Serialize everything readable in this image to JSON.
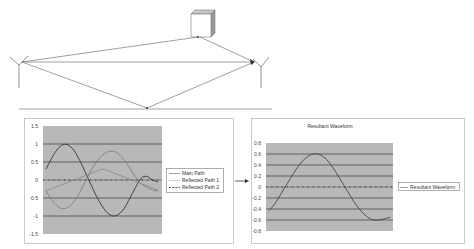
{
  "diagram": {
    "elements": [
      "transmitter-antenna",
      "receiver-antenna",
      "building-reflector",
      "ground-line"
    ],
    "paths": [
      "direct path",
      "path via building",
      "path via ground reflection"
    ]
  },
  "chart_data": [
    {
      "type": "line",
      "title": "",
      "xlabel": "",
      "ylabel": "",
      "ylim": [
        -1.5,
        1.5
      ],
      "yticks": [
        "1.5",
        "1",
        "0.5",
        "0",
        "-0.5",
        "-1",
        "-1.5"
      ],
      "grid": true,
      "legend_position": "right",
      "x": [
        0,
        1,
        2,
        3,
        4,
        5,
        6,
        7,
        8,
        9,
        10,
        11,
        12,
        13,
        14,
        15,
        16,
        17,
        18,
        19,
        20
      ],
      "series": [
        {
          "name": "Main Path",
          "style": "solid",
          "values": [
            0.3,
            0.6,
            0.85,
            0.98,
            0.97,
            0.82,
            0.55,
            0.22,
            -0.12,
            -0.45,
            -0.72,
            -0.92,
            -1.0,
            -0.95,
            -0.78,
            -0.5,
            -0.2,
            0.05,
            0.1,
            0.0,
            -0.05
          ]
        },
        {
          "name": "Reflected Path 1",
          "style": "dotted",
          "values": [
            -0.3,
            -0.55,
            -0.72,
            -0.8,
            -0.75,
            -0.6,
            -0.35,
            -0.05,
            0.25,
            0.5,
            0.68,
            0.78,
            0.8,
            0.72,
            0.55,
            0.32,
            0.08,
            -0.1,
            -0.2,
            -0.28,
            -0.3
          ]
        },
        {
          "name": "Reflected Path 2",
          "style": "dashed",
          "values": [
            -0.3,
            -0.24,
            -0.18,
            -0.12,
            -0.06,
            0.0,
            0.06,
            0.12,
            0.18,
            0.24,
            0.3,
            0.26,
            0.2,
            0.14,
            0.08,
            0.02,
            -0.04,
            -0.1,
            -0.16,
            -0.22,
            -0.28
          ]
        }
      ]
    },
    {
      "type": "line",
      "title": "Resultant Waveform",
      "xlabel": "",
      "ylabel": "",
      "ylim": [
        -0.8,
        0.8
      ],
      "yticks": [
        "0.8",
        "0.6",
        "0.4",
        "0.2",
        "0",
        "-0.2",
        "-0.4",
        "-0.6",
        "-0.8"
      ],
      "grid": true,
      "legend_position": "right",
      "x": [
        0,
        1,
        2,
        3,
        4,
        5,
        6,
        7,
        8,
        9,
        10,
        11,
        12,
        13,
        14,
        15,
        16,
        17,
        18,
        19,
        20
      ],
      "series": [
        {
          "name": "Resultant Waveform",
          "style": "solid",
          "values": [
            -0.43,
            -0.3,
            -0.12,
            0.06,
            0.24,
            0.4,
            0.52,
            0.59,
            0.6,
            0.55,
            0.44,
            0.28,
            0.1,
            -0.08,
            -0.26,
            -0.41,
            -0.52,
            -0.59,
            -0.6,
            -0.58,
            -0.55
          ]
        }
      ]
    }
  ],
  "chart1": {
    "yticks": [
      "1.5",
      "1",
      "0.5",
      "0",
      "-0.5",
      "-1",
      "-1.5"
    ],
    "legend": [
      "Main Path",
      "Reflected Path 1",
      "Reflected Path 2"
    ]
  },
  "chart2": {
    "title": "Resultant Waveform",
    "yticks": [
      "0.8",
      "0.6",
      "0.4",
      "0.2",
      "0",
      "-0.2",
      "-0.4",
      "-0.6",
      "-0.8"
    ],
    "legend": [
      "Resultant Waveform"
    ]
  },
  "colors": {
    "plot_bg": "#b8b8b8",
    "gridline": "#3a3a3a",
    "line_main": "#333333",
    "line_reflected": "#777777",
    "frame": "#bdbdbd"
  }
}
